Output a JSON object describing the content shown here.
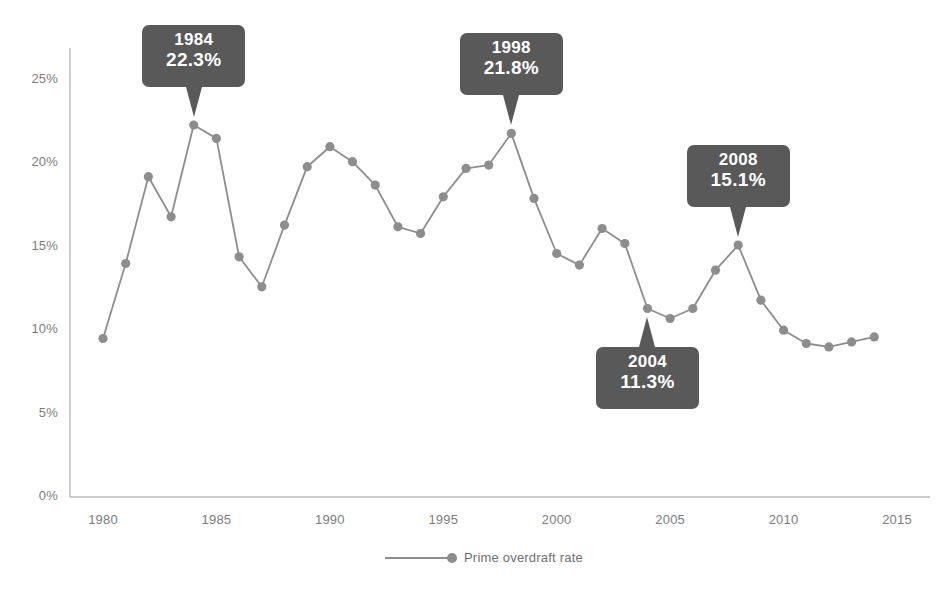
{
  "chart_data": {
    "type": "line",
    "title": "",
    "xlabel": "",
    "ylabel": "",
    "grid": false,
    "legend_position": "bottom-center",
    "xlim": [
      1979,
      2015.5
    ],
    "ylim": [
      0,
      27
    ],
    "x_ticks": [
      "1980",
      "1985",
      "1990",
      "1995",
      "2000",
      "2005",
      "2010",
      "2015"
    ],
    "x_tick_values": [
      1980,
      1985,
      1990,
      1995,
      2000,
      2005,
      2010,
      2015
    ],
    "y_ticks": [
      "0%",
      "5%",
      "10%",
      "15%",
      "20%",
      "25%"
    ],
    "y_tick_values": [
      0,
      5,
      10,
      15,
      20,
      25
    ],
    "series": [
      {
        "name": "Prime overdraft rate",
        "color": "#8d8d8d",
        "x": [
          1980,
          1981,
          1982,
          1983,
          1984,
          1985,
          1986,
          1987,
          1988,
          1989,
          1990,
          1991,
          1992,
          1993,
          1994,
          1995,
          1996,
          1997,
          1998,
          1999,
          2000,
          2001,
          2002,
          2003,
          2004,
          2005,
          2006,
          2007,
          2008,
          2009,
          2010,
          2011,
          2012,
          2013,
          2014
        ],
        "values": [
          9.5,
          14.0,
          19.2,
          16.8,
          22.3,
          21.5,
          14.4,
          12.6,
          16.3,
          19.8,
          21.0,
          20.1,
          18.7,
          16.2,
          15.8,
          18.0,
          19.7,
          19.9,
          21.8,
          17.9,
          14.6,
          13.9,
          16.1,
          15.2,
          11.3,
          10.7,
          11.3,
          13.6,
          15.1,
          11.8,
          10.0,
          9.2,
          9.0,
          9.3,
          9.6
        ]
      }
    ],
    "annotations": [
      {
        "year": "1984",
        "value": "22.3%",
        "x": 1984,
        "y": 22.3,
        "direction": "down"
      },
      {
        "year": "1998",
        "value": "21.8%",
        "x": 1998,
        "y": 21.8,
        "direction": "down"
      },
      {
        "year": "2008",
        "value": "15.1%",
        "x": 2008,
        "y": 15.1,
        "direction": "down"
      },
      {
        "year": "2004",
        "value": "11.3%",
        "x": 2004,
        "y": 11.3,
        "direction": "up"
      }
    ]
  },
  "legend": {
    "label": "Prime overdraft rate"
  },
  "colors": {
    "line": "#8d8d8d",
    "marker": "#8d8d8d",
    "axis": "#b8b8b8",
    "tick_text": "#7c7c7c",
    "tooltip_bg": "#595959",
    "tooltip_text": "#ffffff",
    "background": "#ffffff"
  }
}
